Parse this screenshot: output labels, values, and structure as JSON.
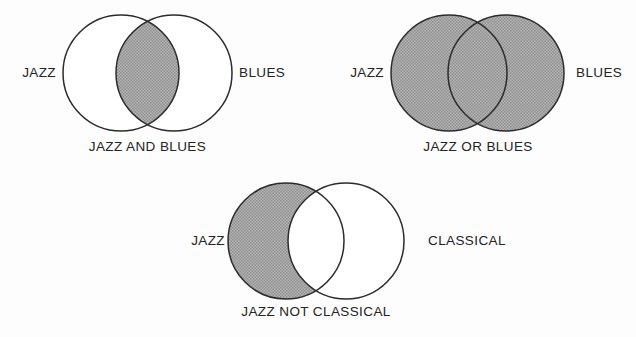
{
  "colors": {
    "stroke": "#2b2b2b",
    "shade_fill": "#a9a9a9",
    "circle_fill": "#ffffff",
    "background": "#fdfdfd",
    "text": "#232323"
  },
  "figures": [
    {
      "id": "intersection",
      "caption": "JAZZ AND BLUES",
      "left_label": "JAZZ",
      "right_label": "BLUES",
      "shaded_region": "intersection"
    },
    {
      "id": "union",
      "caption": "JAZZ OR BLUES",
      "left_label": "JAZZ",
      "right_label": "BLUES",
      "shaded_region": "union"
    },
    {
      "id": "difference",
      "caption": "JAZZ NOT CLASSICAL",
      "left_label": "JAZZ",
      "right_label": "CLASSICAL",
      "shaded_region": "left-only"
    }
  ]
}
